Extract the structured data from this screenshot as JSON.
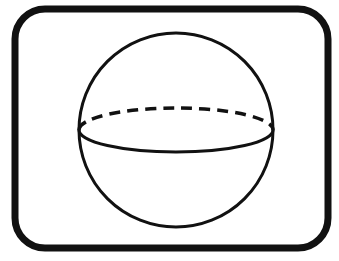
{
  "diagram": {
    "title": "Sphere",
    "shape": "sphere",
    "elements": [
      {
        "name": "frame",
        "type": "rounded-rectangle"
      },
      {
        "name": "outline",
        "type": "circle"
      },
      {
        "name": "equator-front",
        "type": "solid-arc"
      },
      {
        "name": "equator-back",
        "type": "dashed-arc"
      }
    ],
    "colors": {
      "stroke": "#111111",
      "background": "#ffffff"
    }
  }
}
